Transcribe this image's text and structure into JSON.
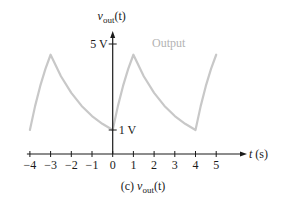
{
  "chart_data": {
    "type": "line",
    "title": "",
    "caption": {
      "prefix": "(c) ",
      "var": "v",
      "sub": "out",
      "suffix": "(t)"
    },
    "ylabel": {
      "var": "v",
      "sub": "out",
      "suffix": "(t)"
    },
    "xlabel": {
      "var": "t",
      "suffix": " (s)"
    },
    "xlim": [
      -4,
      5
    ],
    "ylim": [
      0,
      5
    ],
    "x_ticks": [
      -4,
      -3,
      -2,
      -1,
      0,
      1,
      2,
      3,
      4,
      5
    ],
    "x_tick_labels": [
      "−4",
      "−3",
      "−2",
      "−1",
      "0",
      "1",
      "2",
      "3",
      "4",
      "5"
    ],
    "y_ticks": [
      {
        "value": 5,
        "label": "5 V",
        "label_side": "left"
      },
      {
        "value": 1,
        "label": "1 V",
        "label_side": "right"
      }
    ],
    "grid": false,
    "legend": null,
    "annotations": [
      {
        "text": "Output",
        "position": "upper-right of peak at t=1",
        "color": "#b3b3b3"
      }
    ],
    "series": [
      {
        "name": "Output",
        "color": "#c8c8c8",
        "x": [
          -4,
          -3.75,
          -3.5,
          -3.25,
          -3,
          -2.5,
          -2,
          -1.5,
          -1,
          -0.5,
          0,
          0.25,
          0.5,
          0.75,
          1,
          1.5,
          2,
          2.5,
          3,
          3.5,
          4,
          4.25,
          4.5,
          4.75,
          5
        ],
        "y": [
          1.0,
          2.11,
          3.05,
          3.84,
          4.5,
          3.5,
          2.73,
          2.12,
          1.65,
          1.29,
          1.0,
          2.11,
          3.05,
          3.84,
          4.5,
          3.5,
          2.73,
          2.12,
          1.65,
          1.29,
          1.0,
          2.11,
          3.05,
          3.84,
          4.5
        ]
      }
    ]
  },
  "colors": {
    "axis": "#1a1a1a",
    "curve": "#c8c8c8",
    "output_label": "#b3b3b3",
    "text": "#1a1a1a"
  }
}
